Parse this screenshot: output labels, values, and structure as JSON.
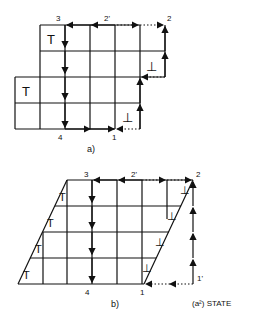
{
  "figure_a": {
    "caption": "a)",
    "labels": {
      "p1": "1",
      "p2": "2",
      "p2prime": "2'",
      "p3": "3",
      "p4": "4"
    },
    "positive_symbols": [
      "T",
      "T"
    ],
    "negative_symbols": [
      "⊥",
      "⊥"
    ]
  },
  "figure_b": {
    "caption": "b)",
    "state_label": "(a²) STATE",
    "labels": {
      "p1": "1",
      "p1prime": "1'",
      "p2": "2",
      "p2prime": "2'",
      "p3": "3",
      "p4": "4"
    },
    "positive_symbols": [
      "T",
      "T",
      "T",
      "T"
    ],
    "negative_symbols": [
      "⊥",
      "⊥",
      "⊥",
      "⊥"
    ]
  },
  "colors": {
    "ink": "#111111",
    "background": "#ffffff"
  }
}
